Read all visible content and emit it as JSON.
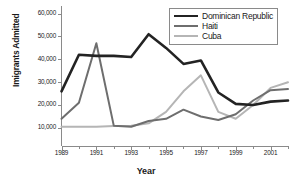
{
  "chart_data": {
    "type": "line",
    "title": "",
    "xlabel": "Year",
    "ylabel": "Imigrants Admitted",
    "x": [
      1989,
      1990,
      1991,
      1992,
      1993,
      1994,
      1995,
      1996,
      1997,
      1998,
      1999,
      2000,
      2001,
      2002
    ],
    "xlim": [
      1989,
      2002
    ],
    "ylim": [
      0,
      60000
    ],
    "xticks": [
      1989,
      1991,
      1993,
      1995,
      1997,
      1999,
      2001
    ],
    "xtick_labels": [
      "1989",
      "1991",
      "1993",
      "1995",
      "1997",
      "1999",
      "2001"
    ],
    "yticks": [
      10000,
      20000,
      30000,
      40000,
      50000,
      60000
    ],
    "ytick_labels": [
      "10,000",
      "20,000",
      "30,000",
      "40,000",
      "50,000",
      "60,000"
    ],
    "grid": false,
    "legend_position": "top-right",
    "series": [
      {
        "name": "Dominican Republic",
        "color": "#232323",
        "width": 2.6,
        "values": [
          26000,
          42000,
          41500,
          41500,
          41000,
          51000,
          45000,
          38000,
          39500,
          25500,
          20500,
          20000,
          21500,
          22000
        ]
      },
      {
        "name": "Haiti",
        "color": "#6e6e6e",
        "width": 2.0,
        "values": [
          14000,
          21000,
          47000,
          11000,
          10500,
          13000,
          14000,
          18000,
          15000,
          13500,
          16000,
          22000,
          26500,
          27000
        ]
      },
      {
        "name": "Cuba",
        "color": "#b5b5b5",
        "width": 2.0,
        "values": [
          10500,
          10500,
          10500,
          10800,
          11000,
          12000,
          17000,
          26000,
          33000,
          17000,
          14000,
          20000,
          27500,
          30000
        ]
      }
    ]
  },
  "legend": {
    "items": [
      {
        "label": "Dominican Republic",
        "color": "#232323"
      },
      {
        "label": "Haiti",
        "color": "#6e6e6e"
      },
      {
        "label": "Cuba",
        "color": "#b5b5b5"
      }
    ]
  },
  "axes": {
    "axis_color": "#8a8a8a",
    "text_color": "#1a1a1a"
  }
}
